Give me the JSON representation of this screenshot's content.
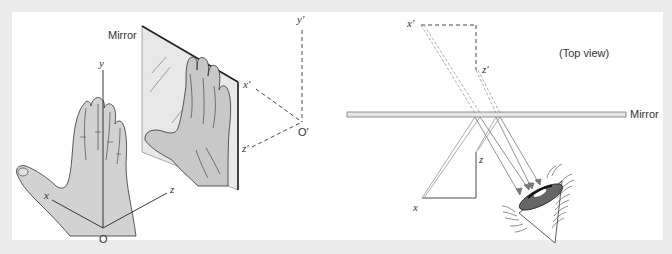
{
  "left_figure": {
    "mirror_label": "Mirror",
    "axes": {
      "y": "y",
      "x": "x",
      "z": "z",
      "origin": "O"
    },
    "image_axes": {
      "y": "y′",
      "x": "x′",
      "z": "z′",
      "origin": "O′"
    }
  },
  "right_figure": {
    "view_label": "(Top view)",
    "mirror_label": "Mirror",
    "axes": {
      "x": "x",
      "z": "z"
    },
    "image_axes": {
      "x": "x′",
      "z": "z′"
    }
  },
  "colors": {
    "background": "#ebebeb",
    "panel": "#ffffff",
    "hand_fill": "#d2d2d2",
    "mirror_fill": "#e6e6e6",
    "line": "#333333",
    "ray": "#777777",
    "eye_iris": "#666666"
  }
}
